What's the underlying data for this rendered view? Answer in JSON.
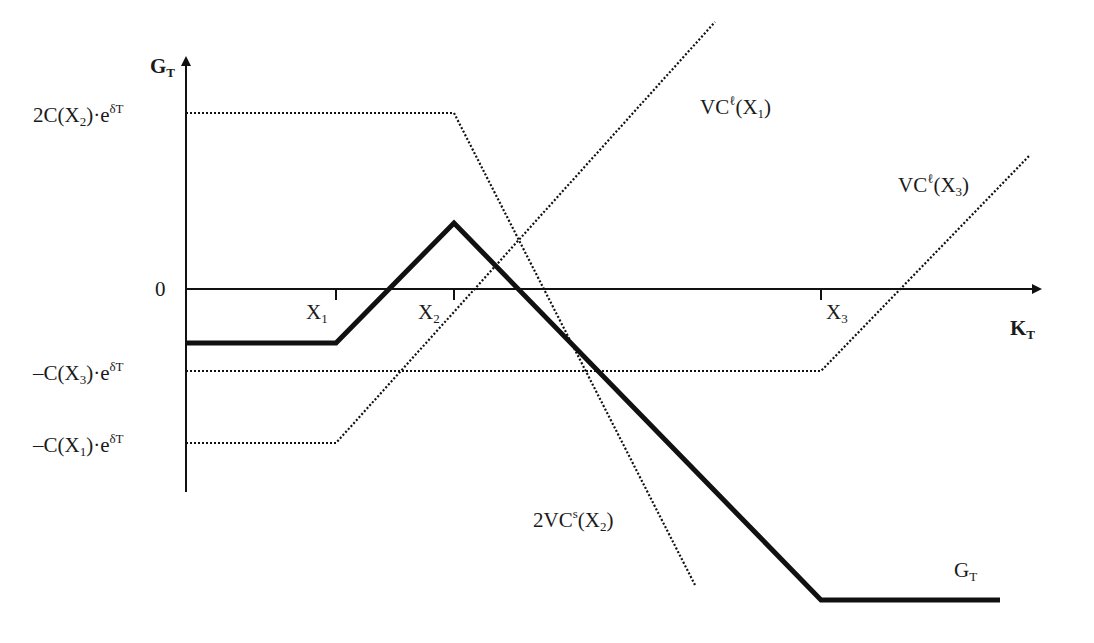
{
  "diagram": {
    "y_axis_label": {
      "main": "G",
      "sub": "T"
    },
    "x_axis_label": {
      "main": "K",
      "sub": "T"
    },
    "y_ticks": [
      {
        "id": "level-2c-x2",
        "main": "2C(X",
        "sub": "2",
        "tail": ")·e",
        "sup": "δT",
        "y": 113
      },
      {
        "id": "zero",
        "main": "0",
        "sub": "",
        "tail": "",
        "sup": "",
        "y": 289
      },
      {
        "id": "level-neg-c-x3",
        "main": "–C(X",
        "sub": "3",
        "tail": ")·e",
        "sup": "δT",
        "y": 371
      },
      {
        "id": "level-neg-c-x1",
        "main": "–C(X",
        "sub": "1",
        "tail": ")·e",
        "sup": "δT",
        "y": 443
      }
    ],
    "x_ticks": [
      {
        "id": "x1",
        "main": "X",
        "sub": "1",
        "x": 336
      },
      {
        "id": "x2",
        "main": "X",
        "sub": "2",
        "x": 454
      },
      {
        "id": "x3",
        "main": "X",
        "sub": "3",
        "x": 821
      }
    ],
    "curves": [
      {
        "id": "gt",
        "label_main": "G",
        "label_sub": "T",
        "label_sup": "",
        "label_tail": "",
        "style": "solid-thick",
        "points": [
          [
            186,
            343
          ],
          [
            336,
            343
          ],
          [
            454,
            223
          ],
          [
            821,
            600
          ],
          [
            1000,
            600
          ]
        ]
      },
      {
        "id": "vc-long-x1",
        "label_main": "VC",
        "label_sup": "ℓ",
        "label_tail": "(X",
        "label_sub": "1",
        "label_end": ")",
        "style": "dotted",
        "points": [
          [
            186,
            443
          ],
          [
            336,
            443
          ],
          [
            715,
            22
          ]
        ]
      },
      {
        "id": "vc-long-x3",
        "label_main": "VC",
        "label_sup": "ℓ",
        "label_tail": "(X",
        "label_sub": "3",
        "label_end": ")",
        "style": "dotted",
        "points": [
          [
            186,
            371
          ],
          [
            821,
            371
          ],
          [
            1030,
            155
          ]
        ]
      },
      {
        "id": "two-vc-short-x2",
        "label_main": "2VC",
        "label_sup": "s",
        "label_tail": "(X",
        "label_sub": "2",
        "label_end": ")",
        "style": "dotted",
        "points": [
          [
            186,
            113
          ],
          [
            454,
            113
          ],
          [
            695,
            585
          ]
        ]
      }
    ],
    "colors": {
      "line": "#111111",
      "background": "#ffffff"
    }
  }
}
